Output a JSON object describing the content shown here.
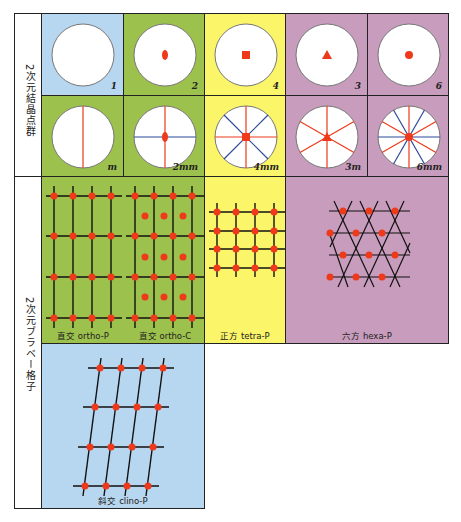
{
  "colors": {
    "blue": "#b7d6ef",
    "green": "#9cc14c",
    "yellow": "#fbf56a",
    "purple": "#c89cbc",
    "red": "#ee3a1a",
    "line_blue": "#2d4a9a"
  },
  "side_labels": {
    "point_groups": "2次元結晶点群",
    "lattices": "2次元ブラベー格子"
  },
  "point_groups": [
    {
      "symbol": "1"
    },
    {
      "symbol": "2"
    },
    {
      "symbol": "4"
    },
    {
      "symbol": "3"
    },
    {
      "symbol": "6"
    },
    {
      "symbol": "m"
    },
    {
      "symbol": "2mm"
    },
    {
      "symbol": "4mm"
    },
    {
      "symbol": "3m"
    },
    {
      "symbol": "6mm"
    }
  ],
  "lattices": [
    {
      "caption": "直交 ortho-P"
    },
    {
      "caption": "直交 ortho-C"
    },
    {
      "caption": "正方 tetra-P"
    },
    {
      "caption": "六方 hexa-P"
    },
    {
      "caption": "斜交 clino-P"
    }
  ]
}
